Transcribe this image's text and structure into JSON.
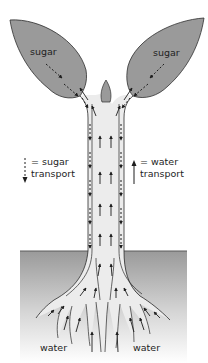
{
  "diagram": {
    "colors": {
      "leaf": "#9a9a9a",
      "leaf_outline": "#3a3a3a",
      "stem": "#ebebeb",
      "outline": "#2a2a2a",
      "soil_top": "#9c9c9c",
      "soil_bottom": "#ffffff",
      "arrow": "#1e1e1e"
    },
    "labels": {
      "leaf_left": "sugar",
      "leaf_right": "sugar",
      "root_left": "water",
      "root_right": "water"
    },
    "legend": {
      "sugar": {
        "icon": "dashed-down-arrow-icon",
        "line1": "= sugar",
        "line2": "transport"
      },
      "water": {
        "icon": "solid-up-arrow-icon",
        "line1": "= water",
        "line2": "transport"
      }
    }
  }
}
